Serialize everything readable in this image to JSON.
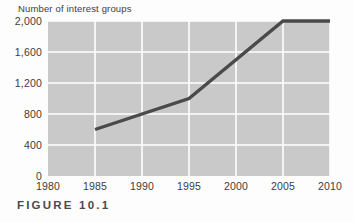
{
  "figure": {
    "caption": "FIGURE 10.1"
  },
  "chart_data": {
    "type": "line",
    "title": "",
    "subtitle": "",
    "xlabel": "",
    "ylabel": "Number of interest groups",
    "x": [
      1985,
      1995,
      2005,
      2010
    ],
    "values": [
      600,
      1000,
      2000,
      2000
    ],
    "series": [
      {
        "name": "Number of interest groups",
        "x": [
          1985,
          1995,
          2005,
          2010
        ],
        "values": [
          600,
          1000,
          2000,
          2000
        ]
      }
    ],
    "xlim": [
      1980,
      2010
    ],
    "ylim": [
      0,
      2000
    ],
    "xticks": [
      1980,
      1985,
      1990,
      1995,
      2000,
      2005,
      2010
    ],
    "xticklabels": [
      "1980",
      "1985",
      "1990",
      "1995",
      "2000",
      "2005",
      "2010"
    ],
    "yticks": [
      0,
      400,
      800,
      1200,
      1600,
      2000
    ],
    "yticklabels": [
      "0",
      "400",
      "800",
      "1,200",
      "1,600",
      "2,000"
    ],
    "grid": true,
    "legend": false,
    "legend_position": "none",
    "annotations": [],
    "colors": {
      "plot_background": "#c9c9c9",
      "gridline": "#ffffff",
      "line": "#4a4a4a",
      "text": "#3c3c3c",
      "page_background": "#fdfdfd"
    }
  }
}
